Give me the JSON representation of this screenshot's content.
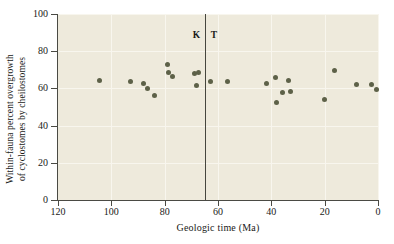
{
  "figure": {
    "background_color": "#ffffff",
    "plot_background_color": "#eeeadc",
    "point_color": "#5d6148",
    "axis_color": "#4a4a44",
    "gridline_color": "#f8f6ee"
  },
  "annotations": {
    "boundary_left_label": "K",
    "boundary_right_label": "T",
    "boundary_value": 65
  },
  "chart_data": {
    "type": "scatter",
    "title": "",
    "xlabel": "Geologic time (Ma)",
    "ylabel": "Within-fauna percent overgrowth of cyclostomes by cheilostomes",
    "ylabel_line1": "Within-fauna percent overgrowth",
    "ylabel_line2": "of cyclostomes by cheilostomes",
    "xlim": [
      120,
      0
    ],
    "ylim": [
      0,
      100
    ],
    "x_inverted": true,
    "grid": true,
    "legend": "none",
    "xticks": [
      120,
      100,
      80,
      60,
      40,
      20,
      0
    ],
    "xticklabels": [
      "120",
      "100",
      "80",
      "60",
      "40",
      "20",
      "0"
    ],
    "yticks": [
      0,
      20,
      40,
      60,
      80,
      100
    ],
    "yticklabels": [
      "0",
      "20",
      "40",
      "60",
      "80",
      "100"
    ],
    "marker": "circle",
    "points": [
      {
        "x": 104.5,
        "y": 64.5
      },
      {
        "x": 93.0,
        "y": 63.5
      },
      {
        "x": 88.0,
        "y": 62.5
      },
      {
        "x": 86.5,
        "y": 60.0
      },
      {
        "x": 84.0,
        "y": 56.0
      },
      {
        "x": 79.0,
        "y": 73.0
      },
      {
        "x": 78.5,
        "y": 68.5
      },
      {
        "x": 77.0,
        "y": 66.5
      },
      {
        "x": 69.0,
        "y": 68.0
      },
      {
        "x": 67.5,
        "y": 68.5
      },
      {
        "x": 68.0,
        "y": 61.5
      },
      {
        "x": 63.0,
        "y": 63.5
      },
      {
        "x": 56.5,
        "y": 63.5
      },
      {
        "x": 42.0,
        "y": 62.5
      },
      {
        "x": 38.5,
        "y": 66.0
      },
      {
        "x": 38.0,
        "y": 52.5
      },
      {
        "x": 36.0,
        "y": 58.0
      },
      {
        "x": 33.5,
        "y": 64.0
      },
      {
        "x": 33.0,
        "y": 58.5
      },
      {
        "x": 20.0,
        "y": 54.0
      },
      {
        "x": 16.5,
        "y": 69.5
      },
      {
        "x": 8.0,
        "y": 62.0
      },
      {
        "x": 2.5,
        "y": 62.0
      },
      {
        "x": 0.5,
        "y": 59.5
      }
    ]
  }
}
